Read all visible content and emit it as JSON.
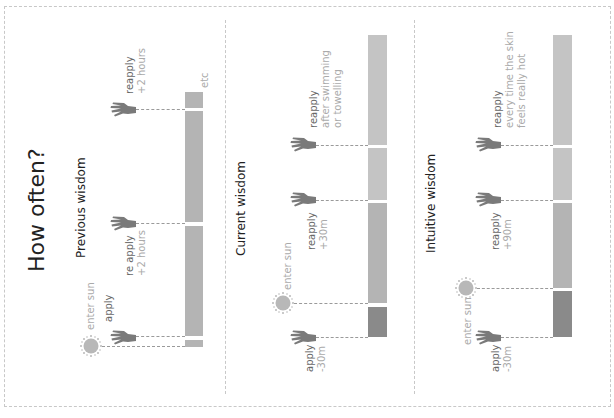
{
  "title": "How often?",
  "colors": {
    "bar_light": "#c4c4c4",
    "bar_mid": "#b4b4b4",
    "bar_dark": "#8a8a8a",
    "icon": "#7a7a7a",
    "sun": "#b8b8b8",
    "label_dark": "#666666",
    "label_light": "#aaaaaa"
  },
  "panels": [
    {
      "title": "Previous wisdom",
      "events": [
        {
          "icon": "sun-icon",
          "label": "enter sun",
          "detail": ""
        },
        {
          "icon": "hand-icon",
          "label": "apply",
          "detail": ""
        },
        {
          "icon": "hand-icon",
          "label": "re apply",
          "detail": "+2 hours"
        },
        {
          "icon": "hand-icon",
          "label": "reapply",
          "detail": "+2 hours"
        }
      ],
      "end_label": "etc"
    },
    {
      "title": "Current wisdom",
      "events": [
        {
          "icon": "hand-icon",
          "label": "apply",
          "detail": "-30m"
        },
        {
          "icon": "sun-icon",
          "label": "enter sun",
          "detail": ""
        },
        {
          "icon": "hand-icon",
          "label": "reapply",
          "detail": "+30m"
        },
        {
          "icon": "hand-icon",
          "label": "reapply",
          "detail": "after swimming",
          "detail2": "or towelling"
        }
      ]
    },
    {
      "title": "Intuitive wisdom",
      "events": [
        {
          "icon": "hand-icon",
          "label": "apply",
          "detail": "-30m"
        },
        {
          "icon": "sun-icon",
          "label": "enter sun",
          "detail": ""
        },
        {
          "icon": "hand-icon",
          "label": "reapply",
          "detail": "+90m"
        },
        {
          "icon": "hand-icon",
          "label": "reapply",
          "detail": "every time the skin",
          "detail2": "feels really hot"
        }
      ]
    }
  ]
}
